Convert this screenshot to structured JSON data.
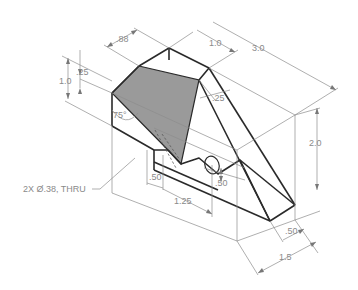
{
  "figure": {
    "type": "isometric-dimensioned-part",
    "shaded_face_color": "#9a9a9a",
    "line_color": "#2a2a2a",
    "dimension_color": "#8a8a8a"
  },
  "dimensions": {
    "d_088": ".88",
    "d_10_top": "1.0",
    "d_30": "3.0",
    "d_025_left": ".25",
    "d_10_left": "1.0",
    "d_75deg": "75°",
    "d_025_mid": ".25",
    "d_20": "2.0",
    "d_050_hole_x": ".50",
    "d_125": "1.25",
    "d_050_hole_z": ".50",
    "d_050_right": ".50",
    "d_15": "1.5"
  },
  "callouts": {
    "hole_note": "2X Ø.38, THRU"
  }
}
